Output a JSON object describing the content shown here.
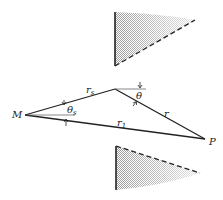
{
  "diagram": {
    "colors": {
      "line": "#222222",
      "shade": "#c8c8c8",
      "background": "#ffffff"
    },
    "points": {
      "M": {
        "label": "M",
        "x": 25,
        "y": 115
      },
      "S": {
        "x": 115,
        "y": 89
      },
      "P": {
        "label": "P",
        "x": 205,
        "y": 139
      }
    },
    "segments": [
      {
        "id": "rs",
        "from": "M",
        "to": "S",
        "label": "r",
        "subscript": "s"
      },
      {
        "id": "r",
        "from": "S",
        "to": "P",
        "label": "r",
        "subscript": ""
      },
      {
        "id": "r1",
        "from": "M",
        "to": "P",
        "label": "r",
        "subscript": "1"
      }
    ],
    "angles": [
      {
        "id": "theta",
        "label": "θ",
        "subscript": "",
        "at": "S"
      },
      {
        "id": "theta_s",
        "label": "θ",
        "subscript": "s",
        "at": "M"
      }
    ],
    "screens": [
      {
        "id": "upper-screen",
        "edge_top": [
          115,
          12
        ],
        "edge_bottom": [
          115,
          66
        ],
        "dashed_end": [
          195,
          20
        ]
      },
      {
        "id": "lower-screen",
        "edge_top": [
          116,
          146
        ],
        "edge_bottom": [
          116,
          190
        ],
        "dashed_end": [
          200,
          173
        ]
      }
    ]
  },
  "labels": {
    "M": "M",
    "P": "P",
    "r_s_main": "r",
    "r_s_sub": "s",
    "r_main": "r",
    "r1_main": "r",
    "r1_sub": "1",
    "theta": "θ",
    "theta_s_main": "θ",
    "theta_s_sub": "s"
  }
}
